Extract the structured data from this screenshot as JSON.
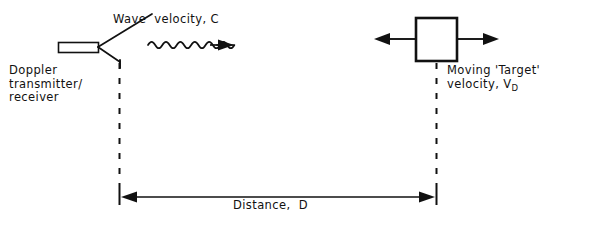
{
  "diagram": {
    "ink_color": "#111111",
    "background_color": "#ffffff",
    "labels": {
      "wave_velocity": "Wave  velocity, C",
      "doppler_line1": "Doppler",
      "doppler_line2": "transmitter/",
      "doppler_line3": "receiver",
      "moving_target_line1": "Moving 'Target'",
      "moving_target_line2_prefix": "velocity, V",
      "moving_target_line2_subscript": "D",
      "distance": "Distance,  D"
    },
    "elements": {
      "transmitter_name": "doppler-transmitter-receiver-antenna",
      "wave_name": "propagating-wave-arrow",
      "target_name": "moving-target-block",
      "target_left_arrow": "target-velocity-arrow-left",
      "target_right_arrow": "target-velocity-arrow-right",
      "left_datum": "transmitter-datum-dashed-line",
      "right_datum": "target-datum-dashed-line",
      "distance_dimension": "distance-dimension-arrow"
    },
    "geometry": {
      "waveguide_x": 58,
      "waveguide_y": 42,
      "waveguide_w": 40,
      "waveguide_h": 10,
      "target_x": 415,
      "target_y": 17,
      "target_size": 43,
      "left_datum_x": 119,
      "right_datum_x": 436,
      "datum_top_y": 62,
      "datum_bottom_y": 195,
      "dimension_y": 197,
      "wave_cycles": 8
    }
  }
}
